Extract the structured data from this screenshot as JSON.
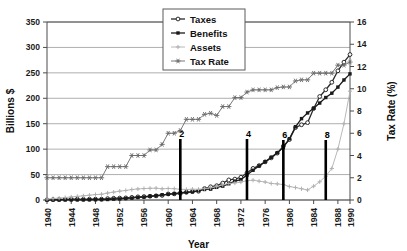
{
  "chart_data": {
    "type": "line",
    "title": "",
    "xlabel": "Year",
    "ylabel": "Billions $",
    "y2label": "Tax Rate (%)",
    "xlim": [
      1940,
      1990
    ],
    "ylim": [
      0,
      350
    ],
    "y2lim": [
      0,
      16
    ],
    "grid": true,
    "legend_position": "top-center-right",
    "xticks": [
      1940,
      1944,
      1948,
      1952,
      1956,
      1960,
      1964,
      1968,
      1972,
      1976,
      1980,
      1984,
      1988,
      1990
    ],
    "xtick_labels": [
      "1940",
      "1944",
      "1948",
      "1952",
      "1956",
      "1960",
      "1964",
      "1968",
      "1972",
      "1976",
      "1980",
      "1984",
      "1988",
      "1990"
    ],
    "yticks": [
      0,
      50,
      100,
      150,
      200,
      250,
      300,
      350
    ],
    "ytick_labels": [
      "0",
      "50",
      "100",
      "150",
      "200",
      "250",
      "300",
      "350"
    ],
    "y2ticks": [
      0,
      2,
      4,
      6,
      8,
      10,
      12,
      14,
      16
    ],
    "y2tick_labels": [
      "0",
      "2",
      "4",
      "6",
      "8",
      "10",
      "12",
      "14",
      "16"
    ],
    "x": [
      1940,
      1941,
      1942,
      1943,
      1944,
      1945,
      1946,
      1947,
      1948,
      1949,
      1950,
      1951,
      1952,
      1953,
      1954,
      1955,
      1956,
      1957,
      1958,
      1959,
      1960,
      1961,
      1962,
      1963,
      1964,
      1965,
      1966,
      1967,
      1968,
      1969,
      1970,
      1971,
      1972,
      1973,
      1974,
      1975,
      1976,
      1977,
      1978,
      1979,
      1980,
      1981,
      1982,
      1983,
      1984,
      1985,
      1986,
      1987,
      1988,
      1989,
      1990
    ],
    "series": [
      {
        "name": "Taxes",
        "axis": "left",
        "marker": "open-circle",
        "color": "#2a2a2a",
        "values": [
          0.4,
          0.8,
          1.0,
          1.3,
          1.6,
          1.7,
          1.4,
          1.6,
          1.7,
          1.7,
          2.7,
          3.4,
          3.8,
          4.1,
          5.2,
          6.2,
          6.7,
          7.4,
          8.1,
          9.1,
          11.9,
          12.1,
          12.8,
          15.1,
          16.6,
          17.2,
          22.5,
          26.0,
          28.1,
          33.3,
          39.5,
          41.1,
          44.7,
          53.1,
          62.1,
          67.6,
          75.0,
          82.8,
          92.2,
          105.9,
          118.8,
          142.4,
          147.9,
          152.1,
          180.0,
          203.5,
          216.8,
          231.5,
          254.0,
          271.0,
          286.0
        ]
      },
      {
        "name": "Benefits",
        "axis": "left",
        "marker": "filled-square",
        "color": "#1a1a1a",
        "values": [
          0.06,
          0.1,
          0.15,
          0.2,
          0.25,
          0.3,
          0.4,
          0.5,
          0.6,
          0.7,
          1.0,
          1.9,
          2.2,
          3.0,
          3.7,
          5.0,
          5.7,
          7.4,
          8.6,
          10.3,
          11.2,
          12.5,
          14.4,
          15.2,
          16.0,
          18.3,
          20.7,
          21.4,
          24.9,
          27.3,
          31.9,
          37.2,
          40.2,
          49.1,
          58.5,
          67.0,
          75.3,
          84.0,
          92.9,
          103.2,
          120.5,
          144.0,
          160.0,
          171.2,
          180.4,
          190.6,
          201.5,
          210.0,
          222.0,
          236.0,
          248.0
        ]
      },
      {
        "name": "Assets",
        "axis": "left",
        "marker": "light-plus",
        "color": "#b0b0b0",
        "values": [
          2.0,
          2.8,
          3.7,
          4.8,
          6.0,
          7.1,
          8.2,
          9.4,
          10.7,
          11.3,
          13.7,
          15.5,
          17.4,
          18.7,
          20.6,
          21.7,
          22.5,
          23.0,
          23.2,
          22.0,
          22.6,
          22.2,
          21.0,
          20.7,
          21.2,
          21.0,
          22.3,
          24.2,
          26.3,
          29.8,
          32.5,
          33.5,
          35.3,
          37.8,
          39.0,
          37.0,
          35.4,
          32.5,
          31.7,
          30.3,
          26.5,
          24.5,
          22.1,
          19.7,
          27.1,
          35.8,
          46.9,
          62.0,
          100.0,
          150.0,
          214.0
        ]
      },
      {
        "name": "Tax Rate",
        "axis": "right",
        "marker": "star",
        "color": "#6a6a6a",
        "values": [
          2.0,
          2.0,
          2.0,
          2.0,
          2.0,
          2.0,
          2.0,
          2.0,
          2.0,
          2.0,
          3.0,
          3.0,
          3.0,
          3.0,
          4.0,
          4.0,
          4.0,
          4.5,
          4.5,
          5.0,
          6.0,
          6.0,
          6.25,
          7.25,
          7.25,
          7.25,
          7.7,
          7.8,
          7.6,
          8.4,
          8.4,
          9.2,
          9.2,
          9.7,
          9.9,
          9.9,
          9.9,
          9.9,
          10.1,
          10.16,
          10.16,
          10.7,
          10.8,
          10.8,
          11.4,
          11.4,
          11.4,
          11.4,
          12.12,
          12.12,
          12.4
        ]
      }
    ],
    "markers": [
      {
        "label": "2",
        "year": 1962,
        "top_value": 120
      },
      {
        "label": "4",
        "year": 1973,
        "top_value": 120
      },
      {
        "label": "6",
        "year": 1979,
        "top_value": 118
      },
      {
        "label": "8",
        "year": 1986,
        "top_value": 118
      }
    ]
  },
  "legend": {
    "items": [
      {
        "label": "Taxes"
      },
      {
        "label": "Benefits"
      },
      {
        "label": "Assets"
      },
      {
        "label": "Tax Rate"
      }
    ]
  }
}
